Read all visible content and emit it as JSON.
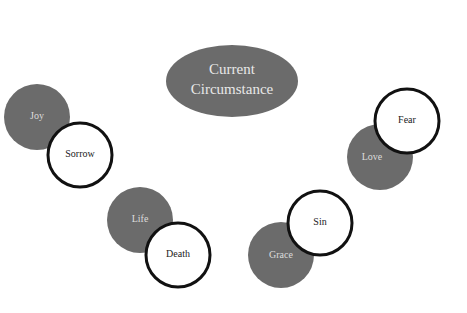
{
  "center": {
    "line1": "Current",
    "line2": "Circumstance"
  },
  "pairs": [
    {
      "filled": "Joy",
      "outlined": "Sorrow"
    },
    {
      "filled": "Life",
      "outlined": "Death"
    },
    {
      "filled": "Grace",
      "outlined": "Sin"
    },
    {
      "filled": "Love",
      "outlined": "Fear"
    }
  ],
  "colors": {
    "filled": "#6b6b6b",
    "outline": "#111111",
    "background": "#ffffff"
  }
}
